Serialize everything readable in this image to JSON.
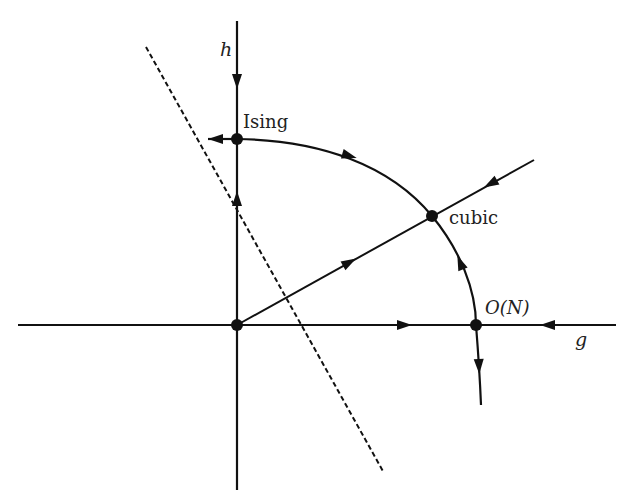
{
  "diagram": {
    "type": "RG flow diagram",
    "axes": {
      "horizontal": {
        "label": "g"
      },
      "vertical": {
        "label": "h"
      }
    },
    "fixed_points": [
      {
        "id": "gaussian",
        "label": ""
      },
      {
        "id": "ising",
        "label": "Ising"
      },
      {
        "id": "cubic",
        "label": "cubic"
      },
      {
        "id": "on",
        "label": "O(N)"
      }
    ],
    "colors": {
      "line": "#111111",
      "background": "#ffffff"
    }
  }
}
